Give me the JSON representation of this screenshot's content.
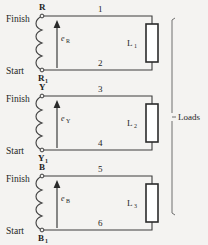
{
  "diagram": {
    "type": "electrical-schematic",
    "colors": {
      "background": "#f4f3f1",
      "wire": "#3d3d3d",
      "load_box_fill": "#ffffff",
      "load_box_stroke": "#2b2b2b",
      "text": "#1f1f1f",
      "bracket": "#6e6e6e"
    },
    "side_labels": {
      "finish": "Finish",
      "start": "Start"
    },
    "group_label": "Loads",
    "phases": [
      {
        "name": "R-phase",
        "finish_terminal": "R",
        "start_terminal": "R",
        "start_terminal_sub": "1",
        "emf": "e",
        "emf_sub": "R",
        "top_wire_number": "1",
        "bottom_wire_number": "2",
        "load": "L",
        "load_sub": "1"
      },
      {
        "name": "Y-phase",
        "finish_terminal": "Y",
        "start_terminal": "Y",
        "start_terminal_sub": "1",
        "emf": "e",
        "emf_sub": "Y",
        "top_wire_number": "3",
        "bottom_wire_number": "4",
        "load": "L",
        "load_sub": "2"
      },
      {
        "name": "B-phase",
        "finish_terminal": "B",
        "start_terminal": "B",
        "start_terminal_sub": "1",
        "emf": "e",
        "emf_sub": "B",
        "top_wire_number": "5",
        "bottom_wire_number": "6",
        "load": "L",
        "load_sub": "3"
      }
    ]
  }
}
